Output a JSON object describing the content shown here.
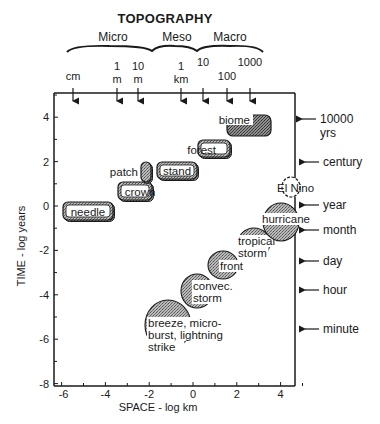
{
  "title": "TOPOGRAPHY",
  "scales": [
    {
      "label": "Micro",
      "x": 113
    },
    {
      "label": "Meso",
      "x": 177
    },
    {
      "label": "Macro",
      "x": 230
    }
  ],
  "brace": {
    "x_start": 67,
    "junction1": 152,
    "junction2": 197,
    "x_end": 263,
    "y": 48
  },
  "top_markers": [
    {
      "lines": [
        "cm"
      ],
      "x": 73
    },
    {
      "lines": [
        "1",
        "m"
      ],
      "x": 117
    },
    {
      "lines": [
        "10",
        "m"
      ],
      "x": 138
    },
    {
      "lines": [
        "1",
        "km"
      ],
      "x": 181
    },
    {
      "lines": [
        "10"
      ],
      "x": 203
    },
    {
      "lines": [
        "100"
      ],
      "x": 227,
      "low": true
    },
    {
      "lines": [
        "1000"
      ],
      "x": 250
    }
  ],
  "right_markers": [
    {
      "lines": [
        "10000",
        "yrs"
      ],
      "y": 119
    },
    {
      "lines": [
        "century"
      ],
      "y": 162
    },
    {
      "lines": [
        "year"
      ],
      "y": 205
    },
    {
      "lines": [
        "month"
      ],
      "y": 230
    },
    {
      "lines": [
        "day"
      ],
      "y": 261
    },
    {
      "lines": [
        "hour"
      ],
      "y": 290
    },
    {
      "lines": [
        "minute"
      ],
      "y": 329
    }
  ],
  "chart_data": {
    "type": "scatter",
    "title": "TOPOGRAPHY",
    "xlabel": "SPACE - log km",
    "ylabel": "TIME - log years",
    "xlim": [
      -6,
      5
    ],
    "ylim": [
      -8,
      5
    ],
    "x_ticks": [
      -6,
      -4,
      -2,
      0,
      2,
      4
    ],
    "y_ticks": [
      4,
      2,
      0,
      -2,
      -4,
      -6,
      -8
    ],
    "ecological_units": [
      {
        "label": "needle",
        "x": -5.2,
        "y": -0.5
      },
      {
        "label": "crown",
        "x": -3.2,
        "y": 0.5
      },
      {
        "label": "patch",
        "x": -1.8,
        "y": 1.5
      },
      {
        "label": "stand",
        "x": -0.9,
        "y": 1.5
      },
      {
        "label": "forest",
        "x": 1.0,
        "y": 2.5
      },
      {
        "label": "biome",
        "x": 2.9,
        "y": 3.6
      }
    ],
    "atmospheric_events": [
      {
        "label": "breeze, micro-burst, lightning strike",
        "lines": [
          "breeze, micro-",
          "burst, lightning",
          "strike"
        ],
        "x": -1.9,
        "y": -5.4
      },
      {
        "label": "convec. storm",
        "lines": [
          "convec.",
          "storm"
        ],
        "x": -0.3,
        "y": -4.0
      },
      {
        "label": "front",
        "lines": [
          "front"
        ],
        "x": 0.9,
        "y": -2.9
      },
      {
        "label": "tropical storm",
        "lines": [
          "tropical",
          "storm"
        ],
        "x": 2.2,
        "y": -1.8
      },
      {
        "label": "hurricane",
        "lines": [
          "hurricane"
        ],
        "x": 3.5,
        "y": -1.0
      },
      {
        "label": "El Nino",
        "lines": [
          "El Nino"
        ],
        "x": 4.3,
        "y": 0.8
      }
    ]
  },
  "colors": {
    "ink": "#1a1a1a",
    "shade": "#8a8a8a",
    "light_shade": "#bdbdbd",
    "background": "#ffffff"
  }
}
